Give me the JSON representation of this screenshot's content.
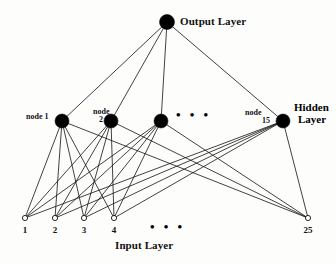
{
  "figure": {
    "type": "neural-network-diagram",
    "width": 336,
    "height": 264,
    "background_color": "#fdfdfc",
    "stroke_color": "#111111",
    "filled_node_color": "#000000",
    "open_node_fill": "#ffffff"
  },
  "labels": {
    "output_layer": "Output Layer",
    "hidden_layer_line1": "Hidden",
    "hidden_layer_line2": "Layer",
    "input_layer": "Input Layer",
    "hidden_node_1": "node 1",
    "hidden_node_2_line1": "node",
    "hidden_node_2_line2": "2",
    "hidden_node_15_line1": "node",
    "hidden_node_15_line2": "15",
    "hidden_ellipsis": "• • •",
    "input_ellipsis": "• • •"
  },
  "chart_data": {
    "type": "diagram",
    "layers": [
      {
        "name": "Output Layer",
        "count": 1,
        "node_style": "filled",
        "nodes": [
          {
            "id": "out",
            "label": "",
            "x": 167,
            "y": 22,
            "r": 7.5
          }
        ]
      },
      {
        "name": "Hidden Layer",
        "count": 15,
        "shown": 4,
        "node_style": "filled",
        "nodes": [
          {
            "id": "h1",
            "label": "node 1",
            "x": 62,
            "y": 121,
            "r": 7
          },
          {
            "id": "h2",
            "label": "node 2",
            "x": 111,
            "y": 121,
            "r": 7
          },
          {
            "id": "h3",
            "label": "",
            "x": 161,
            "y": 121,
            "r": 7
          },
          {
            "id": "h15",
            "label": "node 15",
            "x": 283,
            "y": 121,
            "r": 7
          }
        ]
      },
      {
        "name": "Input Layer",
        "count": 25,
        "shown": 5,
        "node_style": "open",
        "nodes": [
          {
            "id": "i1",
            "label": "1",
            "x": 25,
            "y": 218,
            "r": 2.6
          },
          {
            "id": "i2",
            "label": "2",
            "x": 55,
            "y": 218,
            "r": 2.6
          },
          {
            "id": "i3",
            "label": "3",
            "x": 84,
            "y": 218,
            "r": 2.6
          },
          {
            "id": "i4",
            "label": "4",
            "x": 114,
            "y": 218,
            "r": 2.6
          },
          {
            "id": "i25",
            "label": "25",
            "x": 308,
            "y": 218,
            "r": 2.6
          }
        ]
      }
    ],
    "edges": {
      "output_to_hidden": [
        "h1",
        "h2",
        "h3",
        "h15"
      ],
      "hidden_to_input": [
        "i1",
        "i2",
        "i3",
        "i4",
        "i25"
      ],
      "connectivity": "fully-connected"
    },
    "annotations": [
      {
        "text": "• • •",
        "x": 185,
        "y": 114,
        "layer": "hidden"
      },
      {
        "text": "• • •",
        "x": 160,
        "y": 224,
        "layer": "input"
      }
    ]
  }
}
